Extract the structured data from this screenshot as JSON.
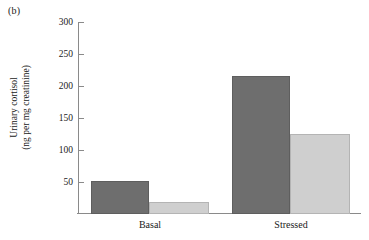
{
  "panel": {
    "label": "(b)"
  },
  "chart_data": {
    "type": "bar",
    "title": "",
    "subtitle": "",
    "xlabel": "",
    "ylabel": "Urinary cortisol (ng per mg creatinine)",
    "ylabel_line1": "Urinary cortisol",
    "ylabel_line2": "(ng per mg creatinine)",
    "categories": [
      "Basal",
      "Stressed"
    ],
    "ylim": [
      0,
      300
    ],
    "yticks": [
      50,
      100,
      150,
      200,
      250,
      300
    ],
    "ytick_labels": [
      "50",
      "100",
      "150",
      "200",
      "250",
      "300"
    ],
    "grid": false,
    "legend": false,
    "legend_position": "none",
    "series": [
      {
        "name": "dark",
        "color": "#6e6e6e",
        "values": [
          52,
          215
        ]
      },
      {
        "name": "light",
        "color": "#cfcfcf",
        "values": [
          18,
          125
        ]
      }
    ]
  },
  "colors": {
    "dark_bar": "#6e6e6e",
    "dark_bar_edge": "#5e5e5e",
    "light_bar": "#cfcfcf",
    "light_bar_edge": "#b4b4b4",
    "axis": "#8a8a8a",
    "text": "#1a1a1a",
    "background": "#ffffff"
  }
}
